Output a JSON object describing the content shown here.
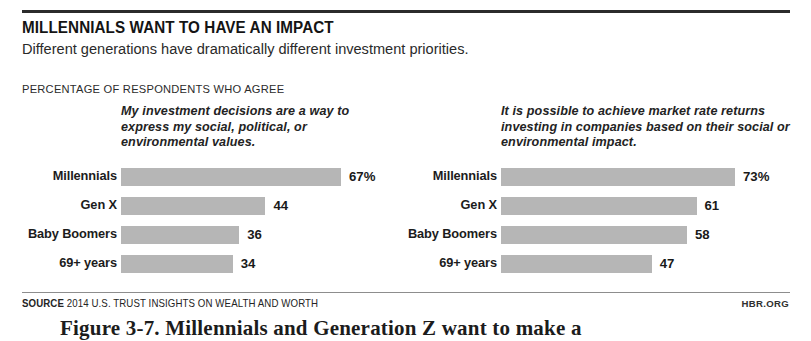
{
  "header": {
    "title": "MILLENNIALS WANT TO HAVE AN IMPACT",
    "subtitle": "Different generations have dramatically different investment priorities.",
    "kicker": "PERCENTAGE OF RESPONDENTS WHO AGREE"
  },
  "footer": {
    "source_label": "SOURCE",
    "source_text": "2014 U.S. TRUST INSIGHTS ON WEALTH AND WORTH",
    "brand": "HBR.ORG",
    "figure_caption": "Figure 3-7. Millennials and Generation Z want to make a"
  },
  "colors": {
    "bar": "#b6b6b6",
    "rule": "#2b2b2b",
    "text": "#1a1a1a"
  },
  "chart_data": [
    {
      "type": "bar",
      "orientation": "horizontal",
      "title": "My investment decisions are a way to express my social, political, or environmental values.",
      "xlabel": "",
      "ylabel": "",
      "xlim": [
        0,
        80
      ],
      "grid": false,
      "legend": "none",
      "categories": [
        "Millennials",
        "Gen X",
        "Baby Boomers",
        "69+ years"
      ],
      "values": [
        67,
        44,
        36,
        34
      ],
      "value_labels": [
        "67%",
        "44",
        "36",
        "34"
      ]
    },
    {
      "type": "bar",
      "orientation": "horizontal",
      "title": "It is possible to achieve market rate returns investing in companies based on their social or environmental impact.",
      "xlabel": "",
      "ylabel": "",
      "xlim": [
        0,
        80
      ],
      "grid": false,
      "legend": "none",
      "categories": [
        "Millennials",
        "Gen X",
        "Baby Boomers",
        "69+ years"
      ],
      "values": [
        73,
        61,
        58,
        47
      ],
      "value_labels": [
        "73%",
        "61",
        "58",
        "47"
      ]
    }
  ]
}
